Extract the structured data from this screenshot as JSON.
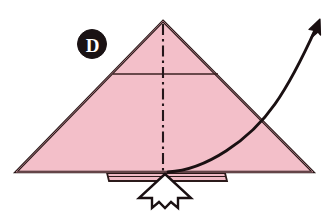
{
  "figure": {
    "background_color": "#ffffff",
    "paper_fill": "#f3bfc9",
    "paper_fill_shade": "#eeb3bf",
    "line_color": "#2b1a1a",
    "arrow_color": "#1a1012",
    "push_arrow_fill": "#ffffff"
  },
  "step_badge": {
    "label": "D",
    "shape": "filled-circle",
    "circle_color": "#1a1214",
    "text_color": "#ffffff",
    "cx": 92,
    "cy": 44,
    "r": 14
  },
  "paper": {
    "shape": "triangle",
    "apex": [
      163,
      21
    ],
    "bottom_left": [
      16,
      172
    ],
    "bottom_right": [
      313,
      172
    ]
  },
  "creases": [
    {
      "name": "horizontal-crease",
      "style": "solid",
      "from": [
        113,
        74
      ],
      "to": [
        218,
        74
      ]
    },
    {
      "name": "center-crease",
      "style": "dash-dot",
      "from": [
        163,
        23
      ],
      "to": [
        163,
        174
      ]
    }
  ],
  "flap_strip": {
    "name": "bottom-flap-strip",
    "left": 107,
    "right": 225,
    "top": 172,
    "bottom": 180,
    "fill": "#f0bac5"
  },
  "push_arrow": {
    "name": "push-arrow",
    "direction": "up",
    "tip": [
      165,
      174
    ],
    "base_y": 207,
    "fill": "#ffffff",
    "stroke": "#1a1012"
  },
  "motion_arrow": {
    "name": "fold-motion-arrow",
    "direction": "up-right",
    "start": [
      168,
      172
    ],
    "end": [
      320,
      21
    ],
    "style": "curved-solid",
    "head": "solid-filled"
  },
  "caption": {
    "alt": "Step D: pink triangle with vertical dash-dot center crease, horizontal crease near top, a small flap beneath the base, a white push arrow pointing up into the flap, and a curved arrow sweeping up to the right."
  }
}
